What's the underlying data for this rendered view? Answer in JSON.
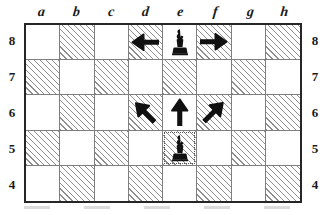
{
  "diagram": {
    "board": {
      "files": [
        "a",
        "b",
        "c",
        "d",
        "e",
        "f",
        "g",
        "h"
      ],
      "ranks": [
        "8",
        "7",
        "6",
        "5",
        "4"
      ],
      "light_color": "#ffffff",
      "dark_color": "#8d8d8d",
      "border_color": "#262626",
      "grid_color": "#7e7e7e"
    },
    "squares": [
      {
        "id": "a8",
        "file": "a",
        "rank": "8",
        "shade": "light"
      },
      {
        "id": "b8",
        "file": "b",
        "rank": "8",
        "shade": "dark"
      },
      {
        "id": "c8",
        "file": "c",
        "rank": "8",
        "shade": "light"
      },
      {
        "id": "d8",
        "file": "d",
        "rank": "8",
        "shade": "dark"
      },
      {
        "id": "e8",
        "file": "e",
        "rank": "8",
        "shade": "light"
      },
      {
        "id": "f8",
        "file": "f",
        "rank": "8",
        "shade": "dark"
      },
      {
        "id": "g8",
        "file": "g",
        "rank": "8",
        "shade": "light"
      },
      {
        "id": "h8",
        "file": "h",
        "rank": "8",
        "shade": "dark"
      },
      {
        "id": "a7",
        "file": "a",
        "rank": "7",
        "shade": "dark"
      },
      {
        "id": "b7",
        "file": "b",
        "rank": "7",
        "shade": "light"
      },
      {
        "id": "c7",
        "file": "c",
        "rank": "7",
        "shade": "dark"
      },
      {
        "id": "d7",
        "file": "d",
        "rank": "7",
        "shade": "light"
      },
      {
        "id": "e7",
        "file": "e",
        "rank": "7",
        "shade": "dark"
      },
      {
        "id": "f7",
        "file": "f",
        "rank": "7",
        "shade": "light"
      },
      {
        "id": "g7",
        "file": "g",
        "rank": "7",
        "shade": "dark"
      },
      {
        "id": "h7",
        "file": "h",
        "rank": "7",
        "shade": "light"
      },
      {
        "id": "a6",
        "file": "a",
        "rank": "6",
        "shade": "light"
      },
      {
        "id": "b6",
        "file": "b",
        "rank": "6",
        "shade": "dark"
      },
      {
        "id": "c6",
        "file": "c",
        "rank": "6",
        "shade": "light"
      },
      {
        "id": "d6",
        "file": "d",
        "rank": "6",
        "shade": "dark"
      },
      {
        "id": "e6",
        "file": "e",
        "rank": "6",
        "shade": "light"
      },
      {
        "id": "f6",
        "file": "f",
        "rank": "6",
        "shade": "dark"
      },
      {
        "id": "g6",
        "file": "g",
        "rank": "6",
        "shade": "light"
      },
      {
        "id": "h6",
        "file": "h",
        "rank": "6",
        "shade": "dark"
      },
      {
        "id": "a5",
        "file": "a",
        "rank": "5",
        "shade": "dark"
      },
      {
        "id": "b5",
        "file": "b",
        "rank": "5",
        "shade": "light"
      },
      {
        "id": "c5",
        "file": "c",
        "rank": "5",
        "shade": "dark"
      },
      {
        "id": "d5",
        "file": "d",
        "rank": "5",
        "shade": "light"
      },
      {
        "id": "e5",
        "file": "e",
        "rank": "5",
        "shade": "dark",
        "highlighted": true
      },
      {
        "id": "f5",
        "file": "f",
        "rank": "5",
        "shade": "light"
      },
      {
        "id": "g5",
        "file": "g",
        "rank": "5",
        "shade": "dark"
      },
      {
        "id": "h5",
        "file": "h",
        "rank": "5",
        "shade": "light"
      },
      {
        "id": "a4",
        "file": "a",
        "rank": "4",
        "shade": "light"
      },
      {
        "id": "b4",
        "file": "b",
        "rank": "4",
        "shade": "dark"
      },
      {
        "id": "c4",
        "file": "c",
        "rank": "4",
        "shade": "light"
      },
      {
        "id": "d4",
        "file": "d",
        "rank": "4",
        "shade": "dark"
      },
      {
        "id": "e4",
        "file": "e",
        "rank": "4",
        "shade": "light"
      },
      {
        "id": "f4",
        "file": "f",
        "rank": "4",
        "shade": "dark"
      },
      {
        "id": "g4",
        "file": "g",
        "rank": "4",
        "shade": "light"
      },
      {
        "id": "h4",
        "file": "h",
        "rank": "4",
        "shade": "dark"
      }
    ],
    "pieces": [
      {
        "square": "e8",
        "color": "black",
        "type": "pawn",
        "glyph": "♟",
        "name": "black-piece-e8"
      },
      {
        "square": "e5",
        "color": "black",
        "type": "pawn",
        "glyph": "♟",
        "name": "black-piece-e5"
      }
    ],
    "arrows": [
      {
        "square": "d8",
        "direction": "left",
        "name": "arrow-left-d8"
      },
      {
        "square": "f8",
        "direction": "right",
        "name": "arrow-right-f8"
      },
      {
        "square": "d6",
        "direction": "up-left",
        "name": "arrow-up-left-d6"
      },
      {
        "square": "e6",
        "direction": "up",
        "name": "arrow-up-e6"
      },
      {
        "square": "f6",
        "direction": "up-right",
        "name": "arrow-up-right-f6"
      }
    ],
    "arrow_color": "#111111"
  }
}
